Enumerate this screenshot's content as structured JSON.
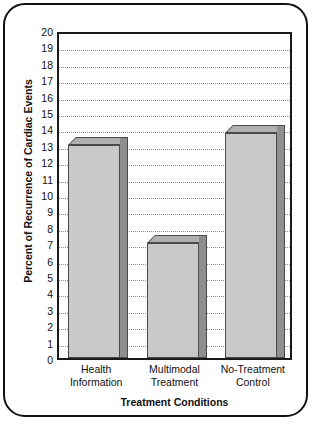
{
  "chart_data": {
    "type": "bar",
    "title": "",
    "xlabel": "Treatment Conditions",
    "ylabel": "Percent of Recurrence of Cardiac Events",
    "categories": [
      "Health Information",
      "Multimodal Treatment",
      "No-Treatment Control"
    ],
    "category_lines": [
      [
        "Health",
        "Information"
      ],
      [
        "Multimodal",
        "Treatment"
      ],
      [
        "No-Treatment",
        "Control"
      ]
    ],
    "values": [
      13.0,
      7.0,
      13.7
    ],
    "ylim": [
      0,
      20
    ],
    "ytick_step": 1,
    "ytick_labels": [
      "20",
      "19",
      "18",
      "17",
      "16",
      "15",
      "14",
      "13",
      "12",
      "11",
      "10",
      "9",
      "8",
      "7",
      "6",
      "5",
      "4",
      "3",
      "2",
      "1",
      "0"
    ],
    "grid": true,
    "grid_style": "dotted-horizontal",
    "legend": "none",
    "bar_style": "3d-extruded",
    "colors": {
      "bar_face": "#c9c9c9",
      "bar_side": "#8f8f8f",
      "bar_top": "#b0b0b0",
      "bar_outline": "#4a4a4a",
      "axis": "#1a1a1a",
      "gridline": "#8d8d8d",
      "text": "#111111",
      "background": "#ffffff"
    }
  }
}
